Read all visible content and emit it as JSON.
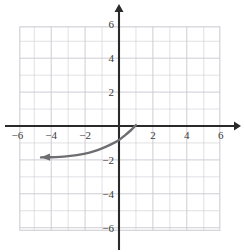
{
  "figure": {
    "title": "",
    "background_color": "#ffffff",
    "grid_color": "#c8c8cf",
    "axis_color": "#2a2a2a",
    "curve_color": "#6e6e72"
  },
  "chart_data": {
    "type": "line",
    "title": "",
    "xlabel": "",
    "ylabel": "",
    "xlim": [
      -7,
      7
    ],
    "ylim": [
      -7,
      7
    ],
    "grid": true,
    "grid_step": 1,
    "legend": "none",
    "axes": {
      "x_arrow_positive": true,
      "x_arrow_negative": false,
      "y_arrow_positive": true,
      "y_arrow_negative": false
    },
    "x_tick_labels": [
      "-6",
      "-4",
      "-2",
      "2",
      "4",
      "6"
    ],
    "x_tick_values": [
      -6,
      -4,
      -2,
      2,
      4,
      6
    ],
    "y_tick_labels": [
      "6",
      "4",
      "2",
      "-2",
      "-4",
      "-6"
    ],
    "y_tick_values": [
      6,
      4,
      2,
      -2,
      -4,
      -6
    ],
    "series": [
      {
        "name": "curve",
        "description": "increasing exponential-type curve, horizontal asymptote near y = -1.85, rises steeply and crosses the x-axis near x = 1",
        "arrow_start": "left",
        "arrow_end": "none",
        "asymptote_y": -1.85,
        "x": [
          -4.6,
          -4.0,
          -3.5,
          -3.0,
          -2.5,
          -2.0,
          -1.5,
          -1.0,
          -0.5,
          0.0,
          0.35,
          0.7,
          0.95,
          1.0
        ],
        "y": [
          -1.85,
          -1.84,
          -1.82,
          -1.78,
          -1.72,
          -1.63,
          -1.5,
          -1.32,
          -1.1,
          -0.82,
          -0.55,
          -0.25,
          0.0,
          0.05
        ]
      }
    ]
  }
}
